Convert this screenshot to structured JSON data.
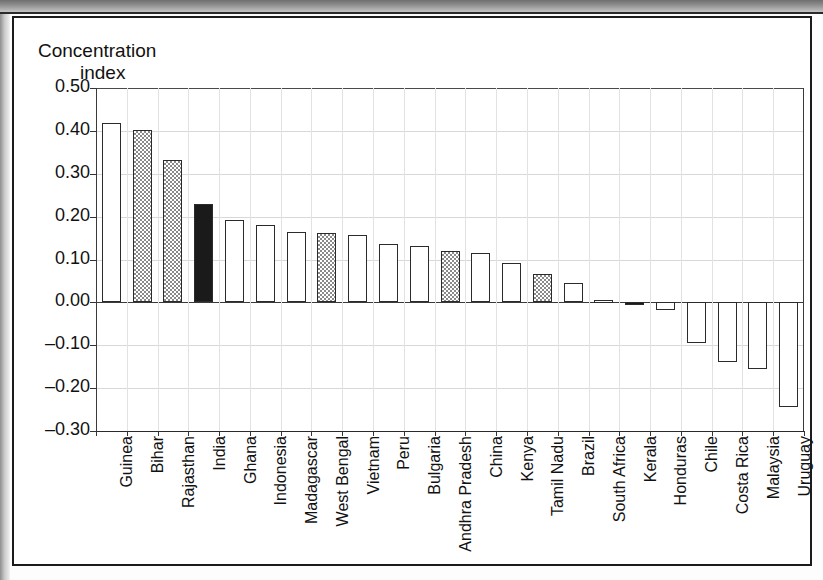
{
  "figure": {
    "scan_header_text": "",
    "axis_title_line1": "Concentration",
    "axis_title_line2": "index"
  },
  "chart_data": {
    "type": "bar",
    "title": "",
    "xlabel": "",
    "ylabel": "Concentration index",
    "ylim": [
      -0.3,
      0.5
    ],
    "ytick_labels": [
      "0.50",
      "0.40",
      "0.30",
      "0.20",
      "0.10",
      "0.00",
      "-0.10",
      "-0.20",
      "-0.30"
    ],
    "ytick_values": [
      0.5,
      0.4,
      0.3,
      0.2,
      0.1,
      0.0,
      -0.1,
      -0.2,
      -0.3
    ],
    "grid": true,
    "legend": null,
    "categories": [
      "Guinea",
      "Bihar",
      "Rajasthan",
      "India",
      "Ghana",
      "Indonesia",
      "Madagascar",
      "West Bengal",
      "Vietnam",
      "Peru",
      "Bulgaria",
      "Andhra Pradesh",
      "China",
      "Kenya",
      "Tamil Nadu",
      "Brazil",
      "South Africa",
      "Kerala",
      "Honduras",
      "Chile",
      "Costa Rica",
      "Malaysia",
      "Uruguay"
    ],
    "values": [
      0.418,
      0.402,
      0.331,
      0.23,
      0.192,
      0.18,
      0.163,
      0.162,
      0.157,
      0.137,
      0.131,
      0.12,
      0.114,
      0.092,
      0.066,
      0.045,
      0.006,
      -0.005,
      -0.017,
      -0.095,
      -0.14,
      -0.155,
      -0.245
    ],
    "fills": [
      "open",
      "gray",
      "gray",
      "solid",
      "open",
      "open",
      "open",
      "gray",
      "open",
      "open",
      "open",
      "gray",
      "open",
      "open",
      "gray",
      "open",
      "open",
      "solid",
      "open",
      "open",
      "open",
      "open",
      "open"
    ],
    "fill_colors": {
      "open": "#ffffff",
      "gray": "#8a8a8a",
      "solid": "#1a1a1a",
      "outline": "#2b2b2b"
    }
  }
}
